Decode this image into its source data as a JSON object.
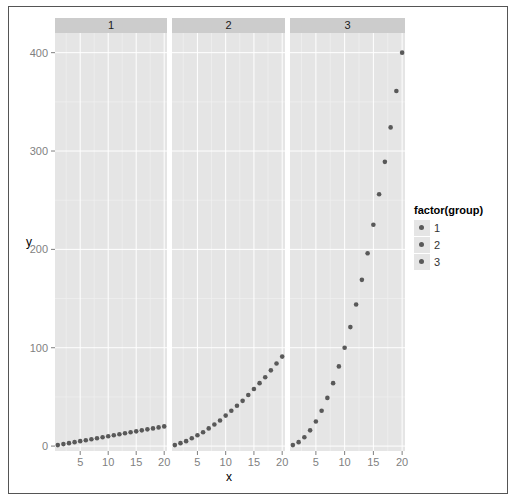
{
  "chart_data": {
    "type": "scatter",
    "facets": [
      "1",
      "2",
      "3"
    ],
    "xlabel": "x",
    "ylabel": "y",
    "x_ticks": [
      5,
      10,
      15,
      20
    ],
    "y_ticks": [
      0,
      100,
      200,
      300,
      400
    ],
    "ylim": [
      -5,
      420
    ],
    "xlim": [
      0.5,
      20.5
    ],
    "grid": true,
    "legend": {
      "title": "factor(group)",
      "entries": [
        "1",
        "2",
        "3"
      ],
      "position": "right"
    },
    "point_color": "#595959",
    "series": [
      {
        "name": "1",
        "x": [
          1,
          2,
          3,
          4,
          5,
          6,
          7,
          8,
          9,
          10,
          11,
          12,
          13,
          14,
          15,
          16,
          17,
          18,
          19,
          20
        ],
        "y": [
          1,
          2,
          3,
          4,
          5,
          6,
          7,
          8,
          9,
          10,
          11,
          12,
          13,
          14,
          15,
          16,
          17,
          18,
          19,
          20
        ]
      },
      {
        "name": "2",
        "x": [
          1,
          2,
          3,
          4,
          5,
          6,
          7,
          8,
          9,
          10,
          11,
          12,
          13,
          14,
          15,
          16,
          17,
          18,
          19,
          20
        ],
        "y": [
          1,
          3,
          5,
          8,
          11,
          14,
          18,
          22,
          26,
          31,
          36,
          41,
          46,
          52,
          58,
          64,
          70,
          77,
          84,
          91
        ]
      },
      {
        "name": "3",
        "x": [
          1,
          2,
          3,
          4,
          5,
          6,
          7,
          8,
          9,
          10,
          11,
          12,
          13,
          14,
          15,
          16,
          17,
          18,
          19,
          20
        ],
        "y": [
          1,
          4,
          9,
          16,
          25,
          36,
          49,
          64,
          81,
          100,
          121,
          144,
          169,
          196,
          225,
          256,
          289,
          324,
          361,
          400
        ]
      }
    ]
  },
  "colors": {
    "panel_bg": "#e5e5e5",
    "strip_bg": "#cccccc",
    "grid_major": "#ffffff",
    "grid_minor": "#f2f2f2",
    "point": "#595959",
    "tick_text": "#7f7f7f"
  }
}
